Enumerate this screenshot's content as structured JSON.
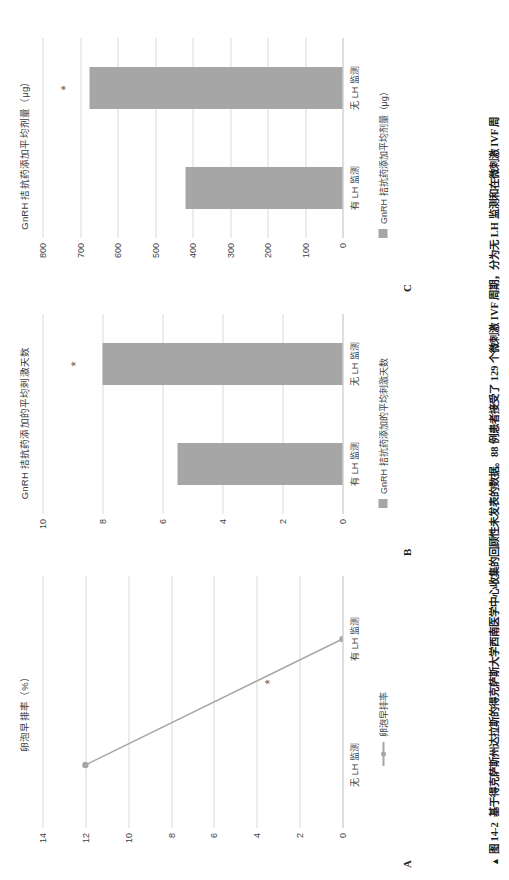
{
  "figure": {
    "caption_marker": "▲",
    "caption_label": "图 14-2",
    "caption_text": "基于得克萨斯州达拉斯的得克萨斯大学西南医学中心收集的回顾性未发表的数据。88 例患者接受了 129 个微刺激 IVF 周期，分为无 LH 监测和在微刺激 IVF 周"
  },
  "panels": [
    {
      "letter": "A",
      "title": "卵泡早排率（%）",
      "legend_label": "卵泡早排率",
      "star": "*"
    },
    {
      "letter": "B",
      "title": "GnRH 拮抗药添加的平均刺激天数",
      "legend_label": "GnRH 拮抗药添加的平均刺激天数",
      "star": "*"
    },
    {
      "letter": "C",
      "title": "GnRH 拮抗药添加平均剂量（μg）",
      "legend_label": "GnRH 拮抗药添加平均剂量（μg）",
      "star": "*"
    }
  ],
  "chart_data": [
    {
      "type": "line",
      "panel": "A",
      "title": "卵泡早排率（%）",
      "categories": [
        "无 LH 监测",
        "有 LH 监测"
      ],
      "values": [
        12,
        0
      ],
      "series": [
        {
          "name": "卵泡早排率",
          "values": [
            12,
            0
          ]
        }
      ],
      "xlabel": "",
      "ylabel": "",
      "ylim": [
        0,
        14
      ],
      "yticks": [
        0,
        2,
        4,
        6,
        8,
        10,
        12,
        14
      ],
      "grid": true,
      "legend_position": "bottom",
      "annotations": [
        {
          "text": "*",
          "x": 0.58,
          "y": 3.4
        }
      ],
      "color": "#a6a6a6"
    },
    {
      "type": "bar",
      "panel": "B",
      "title": "GnRH 拮抗药添加的平均刺激天数",
      "categories": [
        "有 LH 监测",
        "无 LH 监测"
      ],
      "values": [
        5.5,
        8.0
      ],
      "series": [
        {
          "name": "GnRH 拮抗药添加的平均刺激天数",
          "values": [
            5.5,
            8.0
          ]
        }
      ],
      "xlabel": "",
      "ylabel": "",
      "ylim": [
        0,
        10
      ],
      "yticks": [
        0,
        2,
        4,
        6,
        8,
        10
      ],
      "grid": true,
      "legend_position": "bottom",
      "annotations": [
        {
          "text": "*",
          "category": "无 LH 监测",
          "y": 8.9
        }
      ],
      "color": "#a6a6a6"
    },
    {
      "type": "bar",
      "panel": "C",
      "title": "GnRH 拮抗药添加平均剂量（μg）",
      "categories": [
        "有 LH 监测",
        "无 LH 监测"
      ],
      "values": [
        420,
        675
      ],
      "series": [
        {
          "name": "GnRH 拮抗药添加平均剂量（μg）",
          "values": [
            420,
            675
          ]
        }
      ],
      "xlabel": "",
      "ylabel": "μg",
      "ylim": [
        0,
        800
      ],
      "yticks": [
        0,
        100,
        200,
        300,
        400,
        500,
        600,
        700,
        800
      ],
      "grid": true,
      "legend_position": "bottom",
      "annotations": [
        {
          "text": "*",
          "category": "无 LH 监测",
          "y": 740
        }
      ],
      "color": "#a6a6a6"
    }
  ],
  "ticks": {
    "a": [
      "0",
      "2",
      "4",
      "6",
      "8",
      "10",
      "12",
      "14"
    ],
    "b": [
      "0",
      "2",
      "4",
      "6",
      "8",
      "10"
    ],
    "c": [
      "0",
      "100",
      "200",
      "300",
      "400",
      "500",
      "600",
      "700",
      "800"
    ]
  },
  "xlabels": {
    "a": [
      "无 LH 监测",
      "有 LH 监测"
    ],
    "b": [
      "有 LH 监测",
      "无 LH 监测"
    ],
    "c": [
      "有 LH 监测",
      "无 LH 监测"
    ]
  },
  "colors": {
    "bar": "#a6a6a6",
    "grid": "#d9d9d9",
    "text": "#3f3f3f"
  }
}
